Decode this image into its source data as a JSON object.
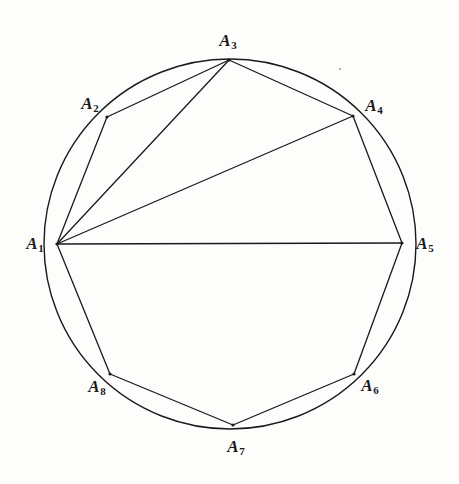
{
  "figure": {
    "kind": "inscribed-polygon-diagram",
    "background_color": "#fdfdfc",
    "stroke_color": "#1a1a1a",
    "width": 459,
    "height": 484,
    "circle": {
      "cx": 230,
      "cy": 244,
      "r": 186,
      "stroke_width": 1.4
    }
  },
  "chart_data": {
    "type": "scatter",
    "title": "",
    "subtitle": "",
    "xlabel": "",
    "ylabel": "",
    "grid": false,
    "legend": null,
    "circle": {
      "cx": 230,
      "cy": 244,
      "r": 186
    },
    "categories": [
      "A1",
      "A2",
      "A3",
      "A4",
      "A5",
      "A6",
      "A7",
      "A8"
    ],
    "points": [
      {
        "id": "A1",
        "label": "A",
        "sub": "1",
        "x": 57,
        "y": 244,
        "angle_deg": 180,
        "label_x": 35,
        "label_y": 245
      },
      {
        "id": "A2",
        "label": "A",
        "sub": "2",
        "x": 107,
        "y": 117,
        "angle_deg": 137,
        "label_x": 90,
        "label_y": 105
      },
      {
        "id": "A3",
        "label": "A",
        "sub": "3",
        "x": 229,
        "y": 60,
        "angle_deg": 96,
        "label_x": 228,
        "label_y": 42
      },
      {
        "id": "A4",
        "label": "A",
        "sub": "4",
        "x": 353,
        "y": 116,
        "angle_deg": 51,
        "label_x": 374,
        "label_y": 107
      },
      {
        "id": "A5",
        "label": "A",
        "sub": "5",
        "x": 402,
        "y": 243,
        "angle_deg": 0,
        "label_x": 425,
        "label_y": 245
      },
      {
        "id": "A6",
        "label": "A",
        "sub": "6",
        "x": 354,
        "y": 374,
        "angle_deg": -35,
        "label_x": 370,
        "label_y": 387
      },
      {
        "id": "A7",
        "label": "A",
        "sub": "7",
        "x": 233,
        "y": 425,
        "angle_deg": -76,
        "label_x": 236,
        "label_y": 448
      },
      {
        "id": "A8",
        "label": "A",
        "sub": "8",
        "x": 110,
        "y": 374,
        "angle_deg": -145,
        "label_x": 97,
        "label_y": 388
      }
    ],
    "edges": [
      {
        "from": "A1",
        "to": "A2",
        "kind": "side"
      },
      {
        "from": "A2",
        "to": "A3",
        "kind": "side"
      },
      {
        "from": "A3",
        "to": "A4",
        "kind": "side"
      },
      {
        "from": "A4",
        "to": "A5",
        "kind": "side"
      },
      {
        "from": "A5",
        "to": "A6",
        "kind": "side"
      },
      {
        "from": "A6",
        "to": "A7",
        "kind": "side"
      },
      {
        "from": "A7",
        "to": "A8",
        "kind": "side"
      },
      {
        "from": "A8",
        "to": "A1",
        "kind": "side"
      },
      {
        "from": "A1",
        "to": "A3",
        "kind": "diagonal"
      },
      {
        "from": "A1",
        "to": "A4",
        "kind": "diagonal"
      },
      {
        "from": "A1",
        "to": "A5",
        "kind": "diameter"
      }
    ],
    "artifacts": [
      {
        "name": "scan-speck",
        "x": 339,
        "y": 68
      }
    ]
  }
}
